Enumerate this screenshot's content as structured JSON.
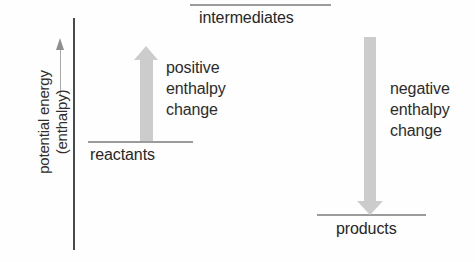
{
  "diagram": {
    "background_color": "#fefefe",
    "axis": {
      "label_line1": "potential energy",
      "label_line2": "(enthalpy)",
      "arrow_direction": "up",
      "axis_color": "#4a4a4a",
      "arrow_color": "#8f8f8f"
    },
    "levels": [
      {
        "id": "reactants",
        "label": "reactants",
        "color": "#9b9b9b"
      },
      {
        "id": "intermediates",
        "label": "intermediates",
        "color": "#9b9b9b"
      },
      {
        "id": "products",
        "label": "products",
        "color": "#9b9b9b"
      }
    ],
    "arrows": [
      {
        "id": "positive",
        "direction": "up",
        "color": "#cccccc",
        "annotation_line1": "positive",
        "annotation_line2": "enthalpy",
        "annotation_line3": "change"
      },
      {
        "id": "negative",
        "direction": "down",
        "color": "#cccccc",
        "annotation_line1": "negative",
        "annotation_line2": "enthalpy",
        "annotation_line3": "change"
      }
    ]
  },
  "chart_data": {
    "type": "line",
    "title": "",
    "xlabel": "",
    "ylabel": "potential energy (enthalpy)",
    "grid": false,
    "legend": "none",
    "categories": [
      "reactants",
      "intermediates",
      "products"
    ],
    "values": [
      1,
      3,
      0
    ],
    "annotations": [
      {
        "between": [
          "reactants",
          "intermediates"
        ],
        "text": "positive enthalpy change",
        "direction": "up"
      },
      {
        "between": [
          "intermediates",
          "products"
        ],
        "text": "negative enthalpy change",
        "direction": "down"
      }
    ]
  }
}
